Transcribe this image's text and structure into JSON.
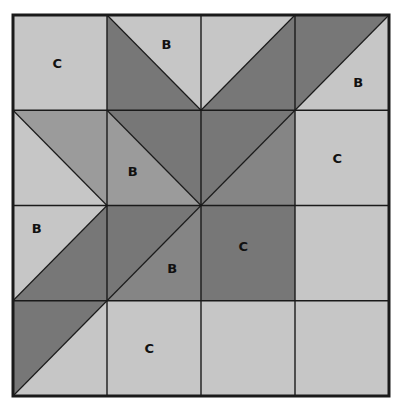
{
  "diagram": {
    "type": "quilt-block",
    "frame": {
      "x": 13,
      "y": 15,
      "width": 376,
      "height": 381
    },
    "rows": 4,
    "cols": 4,
    "colors": {
      "light": "#c6c6c6",
      "medium": "#9b9b9b",
      "medium_dark": "#858585",
      "dark": "#777777",
      "line": "#1a1a1a",
      "background": "#ffffff"
    },
    "cells": [
      {
        "row": 0,
        "col": 0,
        "kind": "solid",
        "fill": "light",
        "label": "C",
        "label_pos": [
          0.42,
          0.5
        ]
      },
      {
        "row": 0,
        "col": 1,
        "kind": "diag-tlbr",
        "lower_left": "dark",
        "upper_right": "light",
        "label": "B",
        "label_pos": [
          0.58,
          0.3
        ]
      },
      {
        "row": 0,
        "col": 2,
        "kind": "diag-bltr",
        "upper_left": "light",
        "lower_right": "dark",
        "label": "",
        "label_pos": [
          0.5,
          0.5
        ]
      },
      {
        "row": 0,
        "col": 3,
        "kind": "diag-bltr",
        "upper_left": "dark",
        "lower_right": "light",
        "label": "B",
        "label_pos": [
          0.62,
          0.7
        ]
      },
      {
        "row": 1,
        "col": 0,
        "kind": "diag-tlbr",
        "lower_left": "light",
        "upper_right": "medium",
        "label": "",
        "label_pos": [
          0.5,
          0.5
        ]
      },
      {
        "row": 1,
        "col": 1,
        "kind": "diag-tlbr",
        "lower_left": "medium",
        "upper_right": "dark",
        "label": "B",
        "label_pos": [
          0.22,
          0.64
        ]
      },
      {
        "row": 1,
        "col": 2,
        "kind": "diag-bltr",
        "upper_left": "dark",
        "lower_right": "medium_dark",
        "label": "",
        "label_pos": [
          0.5,
          0.5
        ]
      },
      {
        "row": 1,
        "col": 3,
        "kind": "solid",
        "fill": "light",
        "label": "C",
        "label_pos": [
          0.4,
          0.5
        ]
      },
      {
        "row": 2,
        "col": 0,
        "kind": "diag-bltr",
        "upper_left": "light",
        "lower_right": "dark",
        "label": "B",
        "label_pos": [
          0.2,
          0.24
        ]
      },
      {
        "row": 2,
        "col": 1,
        "kind": "diag-bltr",
        "upper_left": "dark",
        "lower_right": "medium_dark",
        "label": "B",
        "label_pos": [
          0.64,
          0.66
        ]
      },
      {
        "row": 2,
        "col": 2,
        "kind": "solid",
        "fill": "dark",
        "label": "C",
        "label_pos": [
          0.4,
          0.43
        ]
      },
      {
        "row": 2,
        "col": 3,
        "kind": "solid",
        "fill": "light",
        "label": "",
        "label_pos": [
          0.5,
          0.5
        ]
      },
      {
        "row": 3,
        "col": 0,
        "kind": "diag-bltr",
        "upper_left": "dark",
        "lower_right": "light",
        "label": "",
        "label_pos": [
          0.5,
          0.5
        ]
      },
      {
        "row": 3,
        "col": 1,
        "kind": "solid",
        "fill": "light",
        "label": "C",
        "label_pos": [
          0.4,
          0.5
        ]
      },
      {
        "row": 3,
        "col": 2,
        "kind": "solid",
        "fill": "light",
        "label": "",
        "label_pos": [
          0.5,
          0.5
        ]
      },
      {
        "row": 3,
        "col": 3,
        "kind": "solid",
        "fill": "light",
        "label": "",
        "label_pos": [
          0.5,
          0.5
        ]
      }
    ],
    "labels_legend": [
      "B",
      "C"
    ]
  }
}
